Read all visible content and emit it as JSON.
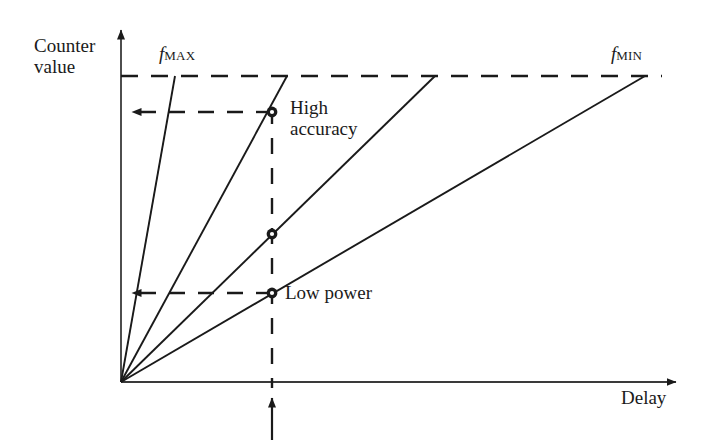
{
  "figure": {
    "type": "diagram",
    "kind": "line-plot-schematic",
    "background_color": "#ffffff",
    "ink_color": "#1a1a1a",
    "axes": {
      "x_axis_label": "Delay",
      "y_axis_label_lines": [
        "Counter",
        "value"
      ],
      "origin": [
        121,
        382
      ],
      "x_axis_end": [
        686,
        382
      ],
      "y_axis_end": [
        121,
        22
      ],
      "x_axis_arrow": "right",
      "y_axis_arrow": "up",
      "ticks": "none",
      "tick_labels": "none",
      "grid": false
    },
    "curve_labels": {
      "fastest": {
        "symbol": "f",
        "subscript": "MAX",
        "x": 159,
        "y": 44
      },
      "slowest": {
        "symbol": "f",
        "subscript": "MIN",
        "x": 611,
        "y": 44
      }
    },
    "rays": [
      {
        "name": "f-max-ray",
        "from": [
          121,
          382
        ],
        "to": [
          175,
          76
        ]
      },
      {
        "name": "second-ray",
        "from": [
          121,
          382
        ],
        "to": [
          287,
          76
        ]
      },
      {
        "name": "third-ray",
        "from": [
          121,
          382
        ],
        "to": [
          435,
          76
        ]
      },
      {
        "name": "f-min-ray",
        "from": [
          121,
          382
        ],
        "to": [
          645,
          76
        ]
      }
    ],
    "saturation_line": {
      "name": "max-count-dashed-line",
      "y": 76,
      "x_start": 121,
      "x_end": 662
    },
    "operating_point_line": {
      "name": "operating-delay-dashed-line",
      "x": 272,
      "y_top": 112,
      "y_bottom": 390
    },
    "operating_point_arrow": {
      "name": "operating-point-arrow",
      "x": 272,
      "y_tip": 390,
      "y_tail": 440,
      "direction": "up"
    },
    "markers": [
      {
        "name": "high-accuracy-marker",
        "x": 272,
        "y": 112,
        "label": "High accuracy"
      },
      {
        "name": "mid-marker",
        "x": 272,
        "y": 234,
        "label": ""
      },
      {
        "name": "low-power-marker",
        "x": 272,
        "y": 293,
        "label": "Low power"
      }
    ],
    "projection_arrows": [
      {
        "name": "high-accuracy-projection-arrow",
        "y": 112,
        "x_from": 272,
        "x_to": 121,
        "direction": "left"
      },
      {
        "name": "low-power-projection-arrow",
        "y": 293,
        "x_from": 272,
        "x_to": 121,
        "direction": "left"
      }
    ],
    "annotations": {
      "high_accuracy_lines": [
        "High",
        "accuracy"
      ],
      "low_power": "Low power"
    }
  }
}
